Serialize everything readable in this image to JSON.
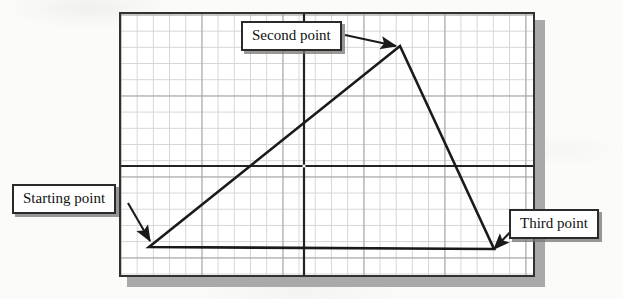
{
  "figure": {
    "background_color": "#fbfbfa",
    "panel": {
      "x": 119,
      "y": 12,
      "width": 416,
      "height": 265,
      "border_color": "#33312f",
      "fill_color": "#ffffff",
      "shadow_color": "#a9a9a9"
    },
    "grid": {
      "minor_spacing_px": 16.2,
      "minor_color": "#cfcfcf",
      "major_spacing_px": 81,
      "major_color": "#8e8e8e",
      "visible": true
    },
    "axes": {
      "color": "#232323",
      "horizontal_y": 164,
      "vertical_x": 302,
      "line_width": 2
    },
    "shape": {
      "type": "triangle",
      "stroke_color": "#1a1a1a",
      "stroke_width": 2.6,
      "fill": "none",
      "closed": true,
      "vertices": [
        {
          "name": "starting-point",
          "label": "Starting point",
          "x": 147,
          "y": 245
        },
        {
          "name": "second-point",
          "label": "Second point",
          "x": 398,
          "y": 44
        },
        {
          "name": "third-point",
          "label": "Third point",
          "x": 492,
          "y": 247
        }
      ]
    }
  },
  "callouts": [
    {
      "id": "starting",
      "label": "Starting point",
      "box": {
        "x": 12,
        "y": 184,
        "width": 116,
        "height": 30
      },
      "arrow": {
        "from_x": 128,
        "from_y": 203,
        "to_x": 150,
        "to_y": 241
      }
    },
    {
      "id": "second",
      "label": "Second point",
      "box": {
        "x": 241,
        "y": 21,
        "width": 104,
        "height": 30
      },
      "arrow": {
        "from_x": 345,
        "from_y": 36,
        "to_x": 396,
        "to_y": 46
      }
    },
    {
      "id": "third",
      "label": "Third point",
      "box": {
        "x": 509,
        "y": 209,
        "width": 96,
        "height": 29
      },
      "arrow": {
        "from_x": 514,
        "from_y": 226,
        "to_x": 493,
        "to_y": 249
      }
    }
  ]
}
